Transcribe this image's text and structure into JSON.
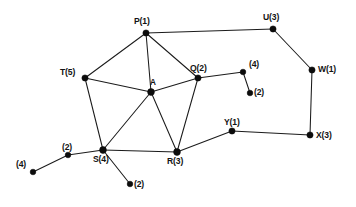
{
  "figure": {
    "kind": "undirected-graph-diagram",
    "background_color": "#ffffff",
    "stroke_color": "#1b1b1b",
    "node_color": "#0c0c0c",
    "width": 356,
    "height": 207
  },
  "nodes": [
    {
      "id": "P",
      "label": "P(1)",
      "name": "P",
      "weight": "1",
      "x": 146,
      "y": 33,
      "r": 3.1,
      "label_x": 134,
      "label_y": 17
    },
    {
      "id": "U",
      "label": "U(3)",
      "name": "U",
      "weight": "3",
      "x": 273,
      "y": 29,
      "r": 3.1,
      "label_x": 263,
      "label_y": 13
    },
    {
      "id": "W",
      "label": "W(1)",
      "name": "W",
      "weight": "1",
      "x": 312,
      "y": 70,
      "r": 3.1,
      "label_x": 318,
      "label_y": 65
    },
    {
      "id": "T",
      "label": "T(5)",
      "name": "T",
      "weight": "5",
      "x": 85,
      "y": 78,
      "r": 3.1,
      "label_x": 60,
      "label_y": 68
    },
    {
      "id": "Q",
      "label": "Q(2)",
      "name": "Q",
      "weight": "2",
      "x": 198,
      "y": 78,
      "r": 3.1,
      "label_x": 190,
      "label_y": 64
    },
    {
      "id": "A",
      "label": "A",
      "name": "A",
      "weight": "",
      "x": 151,
      "y": 92,
      "r": 3.4,
      "label_x": 150,
      "label_y": 79
    },
    {
      "id": "X",
      "label": "X(3)",
      "name": "X",
      "weight": "3",
      "x": 310,
      "y": 135,
      "r": 3.1,
      "label_x": 316,
      "label_y": 131
    },
    {
      "id": "Y",
      "label": "Y(1)",
      "name": "Y",
      "weight": "1",
      "x": 232,
      "y": 131,
      "r": 3.1,
      "label_x": 224,
      "label_y": 118
    },
    {
      "id": "S",
      "label": "S(4)",
      "name": "S",
      "weight": "4",
      "x": 103,
      "y": 150,
      "r": 3.4,
      "label_x": 93,
      "label_y": 155
    },
    {
      "id": "R",
      "label": "R(3)",
      "name": "R",
      "weight": "3",
      "x": 177,
      "y": 152,
      "r": 3.4,
      "label_x": 167,
      "label_y": 157
    },
    {
      "id": "q1",
      "label": "(4)",
      "name": "",
      "weight": "4",
      "x": 243,
      "y": 72,
      "r": 2.8,
      "label_x": 249,
      "label_y": 60
    },
    {
      "id": "q2",
      "label": "(2)",
      "name": "",
      "weight": "2",
      "x": 250,
      "y": 93,
      "r": 2.8,
      "label_x": 254,
      "label_y": 88
    },
    {
      "id": "s1",
      "label": "(2)",
      "name": "",
      "weight": "2",
      "x": 68,
      "y": 155,
      "r": 2.8,
      "label_x": 62,
      "label_y": 143
    },
    {
      "id": "s2",
      "label": "(4)",
      "name": "",
      "weight": "4",
      "x": 33,
      "y": 172,
      "r": 2.8,
      "label_x": 16,
      "label_y": 160
    },
    {
      "id": "s3",
      "label": "(2)",
      "name": "",
      "weight": "2",
      "x": 130,
      "y": 184,
      "r": 2.8,
      "label_x": 134,
      "label_y": 180
    }
  ],
  "edges": [
    {
      "from": "P",
      "to": "U",
      "name": "edge-P-U"
    },
    {
      "from": "P",
      "to": "T",
      "name": "edge-P-T"
    },
    {
      "from": "P",
      "to": "A",
      "name": "edge-P-A"
    },
    {
      "from": "P",
      "to": "Q",
      "name": "edge-P-Q"
    },
    {
      "from": "U",
      "to": "W",
      "name": "edge-U-W"
    },
    {
      "from": "W",
      "to": "X",
      "name": "edge-W-X"
    },
    {
      "from": "X",
      "to": "Y",
      "name": "edge-X-Y"
    },
    {
      "from": "Y",
      "to": "R",
      "name": "edge-Y-R"
    },
    {
      "from": "T",
      "to": "A",
      "name": "edge-T-A"
    },
    {
      "from": "T",
      "to": "S",
      "name": "edge-T-S"
    },
    {
      "from": "A",
      "to": "Q",
      "name": "edge-A-Q"
    },
    {
      "from": "A",
      "to": "S",
      "name": "edge-A-S"
    },
    {
      "from": "A",
      "to": "R",
      "name": "edge-A-R"
    },
    {
      "from": "Q",
      "to": "R",
      "name": "edge-Q-R"
    },
    {
      "from": "S",
      "to": "R",
      "name": "edge-S-R"
    },
    {
      "from": "Q",
      "to": "q1",
      "name": "edge-Q-pendant-4"
    },
    {
      "from": "q1",
      "to": "q2",
      "name": "edge-pendant-4-pendant-2"
    },
    {
      "from": "S",
      "to": "s1",
      "name": "edge-S-pendant-2-left"
    },
    {
      "from": "s1",
      "to": "s2",
      "name": "edge-pendant-2-pendant-4"
    },
    {
      "from": "S",
      "to": "s3",
      "name": "edge-S-pendant-2-below"
    }
  ]
}
